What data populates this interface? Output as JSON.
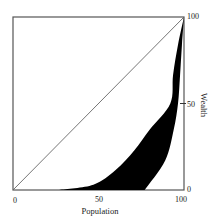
{
  "chart_data": {
    "type": "area",
    "title": "",
    "xlabel": "Population",
    "ylabel": "Wealth",
    "xlim": [
      0,
      100
    ],
    "ylim": [
      0,
      100
    ],
    "grid": false,
    "legend": null,
    "x_ticks": [
      "0",
      "50",
      "100"
    ],
    "y_ticks": [
      "0",
      "50",
      "100"
    ],
    "y_axis_position": "right",
    "series": [
      {
        "name": "line of equality",
        "kind": "line",
        "x": [
          0,
          100
        ],
        "y": [
          0,
          100
        ]
      },
      {
        "name": "outer Lorenz curve",
        "kind": "curve",
        "x": [
          0,
          27,
          47,
          60,
          71,
          80,
          92,
          93.6,
          96.5,
          100
        ],
        "y": [
          0,
          0,
          3,
          11.5,
          23,
          35,
          50,
          66.5,
          84,
          100
        ]
      },
      {
        "name": "inner Lorenz curve",
        "kind": "curve",
        "x": [
          0,
          77,
          89,
          94,
          96.5,
          97.7,
          98.8,
          100
        ],
        "y": [
          0,
          0,
          17,
          35,
          50,
          66.5,
          84,
          100
        ]
      }
    ],
    "shaded_region": "black fill between outer and inner Lorenz curves"
  },
  "labels": {
    "x_tick_0": "0",
    "x_tick_50": "50",
    "x_tick_100": "100",
    "y_tick_0": "0",
    "y_tick_50": "50",
    "y_tick_100": "100",
    "x_title": "Population",
    "y_title": "Wealth"
  },
  "colors": {
    "fill": "#000000",
    "axis": "#555555",
    "diagonal": "#666666"
  }
}
